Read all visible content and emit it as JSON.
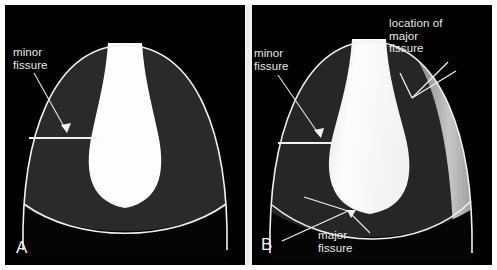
{
  "figure": {
    "background_color": "#ffffff",
    "frame_color": "#ffffff",
    "panel_background": "#010101",
    "lung_field_color": "#2a2a2a",
    "mediastinum_color": "#fdfdfd",
    "outline_color": "#f0f0f0",
    "label_color": "#e8e8e8",
    "fissure_band_color": "#b9b9b9"
  },
  "panel_a": {
    "letter": "A",
    "labels": {
      "minor_fissure": "minor\nfissure"
    }
  },
  "panel_b": {
    "letter": "B",
    "labels": {
      "minor_fissure": "minor\nfissure",
      "major_fissure_location": "location of\nmajor\nfissure",
      "major_fissure": "major\nfissure"
    }
  }
}
